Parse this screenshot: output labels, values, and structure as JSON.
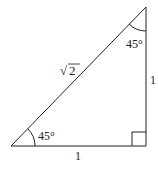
{
  "diagram": {
    "hypotenuse_label": "√2",
    "hyp_radical": "√",
    "hyp_radicand": "2",
    "bottom_leg_label": "1",
    "right_leg_label": "1",
    "bottom_left_angle": "45°",
    "top_angle": "45°",
    "right_angle_marker": "square",
    "stroke_color": "#222222"
  }
}
